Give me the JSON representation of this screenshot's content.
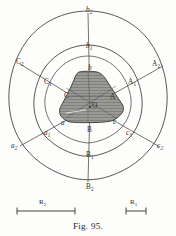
{
  "figure": {
    "caption": "Fig. 95.",
    "center_label": "O",
    "background_color": "#fdfdfc",
    "line_color": "#3a3a3a",
    "shade_fill": "#9a9a96",
    "shade_hatch": "#5b5b58"
  },
  "chart_data": {
    "type": "scatter",
    "title": "Fig. 95.",
    "xlabel": "",
    "ylabel": "",
    "grid": false,
    "legend": null,
    "center": {
      "label": "O",
      "x": 90,
      "y": 107
    },
    "contours": [
      {
        "name": "inner-core",
        "index": 0,
        "shaded": true,
        "vertex_labels": [
          "b",
          "A",
          "c",
          "B",
          "a",
          "C"
        ]
      },
      {
        "name": "contour-1",
        "index": 1,
        "shaded": false,
        "vertex_labels": [
          "b1",
          "A1",
          "c1",
          "B1",
          "a1",
          "C1"
        ]
      },
      {
        "name": "contour-2",
        "index": 2,
        "shaded": false,
        "vertex_labels": [
          "b2",
          "A2",
          "c2",
          "B2",
          "a2",
          "C2"
        ]
      }
    ],
    "axis_labels": [
      {
        "id": "b2",
        "base": "b",
        "sub": "2",
        "style": "italic",
        "x": 86,
        "y": 7,
        "ring": 2,
        "direction": "up"
      },
      {
        "id": "b1",
        "base": "b",
        "sub": "1",
        "style": "italic",
        "x": 86,
        "y": 43,
        "ring": 1,
        "direction": "up"
      },
      {
        "id": "b",
        "base": "b",
        "sub": "",
        "style": "italic",
        "x": 88,
        "y": 65,
        "ring": 0,
        "direction": "up"
      },
      {
        "id": "A2",
        "base": "A",
        "sub": "2",
        "style": "upright",
        "x": 152,
        "y": 61,
        "ring": 2,
        "direction": "upper-right"
      },
      {
        "id": "A1",
        "base": "A",
        "sub": "1",
        "style": "upright",
        "x": 128,
        "y": 79,
        "ring": 1,
        "direction": "upper-right"
      },
      {
        "id": "A",
        "base": "A",
        "sub": "",
        "style": "upright",
        "x": 110,
        "y": 94,
        "ring": 0,
        "direction": "upper-right"
      },
      {
        "id": "C2",
        "base": "C",
        "sub": "2",
        "style": "upright",
        "x": 16,
        "y": 59,
        "ring": 2,
        "direction": "upper-left"
      },
      {
        "id": "C1",
        "base": "C",
        "sub": "1",
        "style": "upright",
        "x": 44,
        "y": 79,
        "ring": 1,
        "direction": "upper-left"
      },
      {
        "id": "C",
        "base": "C",
        "sub": "",
        "style": "upright",
        "x": 64,
        "y": 93,
        "ring": 0,
        "direction": "upper-left"
      },
      {
        "id": "a2",
        "base": "a",
        "sub": "2",
        "style": "italic",
        "x": 11,
        "y": 143,
        "ring": 2,
        "direction": "lower-left"
      },
      {
        "id": "a1",
        "base": "a",
        "sub": "1",
        "style": "italic",
        "x": 44,
        "y": 130,
        "ring": 1,
        "direction": "lower-left"
      },
      {
        "id": "a",
        "base": "a",
        "sub": "",
        "style": "italic",
        "x": 61,
        "y": 120,
        "ring": 0,
        "direction": "lower-left"
      },
      {
        "id": "c2",
        "base": "c",
        "sub": "2",
        "style": "italic",
        "x": 157,
        "y": 143,
        "ring": 2,
        "direction": "lower-right"
      },
      {
        "id": "c1",
        "base": "c",
        "sub": "1",
        "style": "italic",
        "x": 126,
        "y": 130,
        "ring": 1,
        "direction": "lower-right"
      },
      {
        "id": "c",
        "base": "c",
        "sub": "",
        "style": "italic",
        "x": 113,
        "y": 119,
        "ring": 0,
        "direction": "lower-right"
      },
      {
        "id": "B",
        "base": "B",
        "sub": "",
        "style": "upright",
        "x": 87,
        "y": 127,
        "ring": 0,
        "direction": "down"
      },
      {
        "id": "B1",
        "base": "B",
        "sub": "1",
        "style": "upright",
        "x": 86,
        "y": 152,
        "ring": 1,
        "direction": "down"
      },
      {
        "id": "B2",
        "base": "B",
        "sub": "2",
        "style": "upright",
        "x": 86,
        "y": 184,
        "ring": 2,
        "direction": "down"
      }
    ],
    "scale_bars": [
      {
        "id": "R2",
        "base": "R",
        "sub": "2",
        "x1": 17,
        "x2": 75,
        "y": 211,
        "label_x": 39,
        "label_y": 198
      },
      {
        "id": "R1",
        "base": "R",
        "sub": "1",
        "x1": 126,
        "x2": 146,
        "y": 211,
        "label_x": 130,
        "label_y": 198
      }
    ]
  }
}
